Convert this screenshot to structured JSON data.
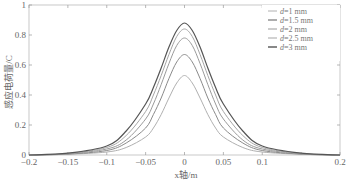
{
  "chart_data": {
    "type": "line",
    "title": "",
    "xlabel": "x轴/m",
    "ylabel": "感应电荷量/C",
    "xlim": [
      -0.2,
      0.2
    ],
    "ylim": [
      0,
      1
    ],
    "grid": false,
    "legend_position": "upper right",
    "x_ticks": [
      -0.2,
      -0.15,
      -0.1,
      -0.05,
      0,
      0.05,
      0.1,
      0.15,
      0.2
    ],
    "x_tick_labels": [
      "-0.2",
      "-0.15",
      "-0.1",
      "-0.05",
      "0",
      "0.05",
      "0.1",
      "",
      "0.2"
    ],
    "y_ticks": [
      0,
      0.2,
      0.4,
      0.6,
      0.8,
      1
    ],
    "y_tick_labels": [
      "0",
      "0.2",
      "0.4",
      "0.6",
      "0.8",
      "1"
    ],
    "x": [
      -0.2,
      -0.15,
      -0.1,
      -0.075,
      -0.05,
      -0.04,
      -0.03,
      -0.02,
      -0.01,
      0,
      0.01,
      0.02,
      0.03,
      0.04,
      0.05,
      0.075,
      0.1,
      0.15,
      0.2
    ],
    "series": [
      {
        "name": "d=1 mm",
        "color": "#b0b0b0",
        "peak": 0.53,
        "values": [
          0.0,
          0.005,
          0.02,
          0.05,
          0.12,
          0.18,
          0.27,
          0.38,
          0.48,
          0.53,
          0.48,
          0.38,
          0.27,
          0.18,
          0.12,
          0.05,
          0.02,
          0.005,
          0.0
        ]
      },
      {
        "name": "d=1.5 mm",
        "color": "#8a8a8a",
        "peak": 0.67,
        "values": [
          0.0,
          0.006,
          0.03,
          0.08,
          0.18,
          0.27,
          0.38,
          0.51,
          0.62,
          0.67,
          0.62,
          0.51,
          0.38,
          0.27,
          0.18,
          0.08,
          0.03,
          0.006,
          0.0
        ]
      },
      {
        "name": "d=2 mm",
        "color": "#9a9a9a",
        "peak": 0.78,
        "values": [
          0.0,
          0.008,
          0.04,
          0.1,
          0.24,
          0.34,
          0.47,
          0.61,
          0.73,
          0.78,
          0.73,
          0.61,
          0.47,
          0.34,
          0.24,
          0.1,
          0.04,
          0.008,
          0.0
        ]
      },
      {
        "name": "d=2.5 mm",
        "color": "#a5a5a5",
        "peak": 0.84,
        "values": [
          0.0,
          0.01,
          0.05,
          0.13,
          0.29,
          0.4,
          0.53,
          0.67,
          0.79,
          0.84,
          0.79,
          0.67,
          0.53,
          0.4,
          0.29,
          0.13,
          0.05,
          0.01,
          0.0
        ]
      },
      {
        "name": "d=3 mm",
        "color": "#555555",
        "peak": 0.88,
        "values": [
          0.0,
          0.012,
          0.06,
          0.16,
          0.34,
          0.45,
          0.58,
          0.72,
          0.83,
          0.88,
          0.83,
          0.72,
          0.58,
          0.45,
          0.34,
          0.16,
          0.06,
          0.012,
          0.0
        ]
      }
    ]
  },
  "legend": {
    "items": [
      {
        "label": "d=1 mm"
      },
      {
        "label": "d=1.5 mm"
      },
      {
        "label": "d=2 mm"
      },
      {
        "label": "d=2.5 mm"
      },
      {
        "label": "d=3 mm"
      }
    ]
  }
}
